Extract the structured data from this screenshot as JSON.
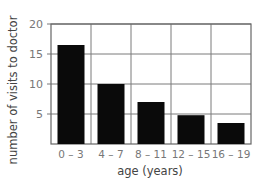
{
  "chart_data": {
    "type": "bar",
    "title": "",
    "xlabel": "age (years)",
    "ylabel": "number of visits to doctor",
    "categories": [
      "0 – 3",
      "4 – 7",
      "8 – 11",
      "12 – 15",
      "16 – 19"
    ],
    "values": [
      16.5,
      10,
      7,
      4.8,
      3.5
    ],
    "ylim": [
      0,
      20
    ],
    "yticks": [
      5,
      10,
      15,
      20
    ],
    "grid": true,
    "bar_color": "#0a0a0a",
    "grid_color": "#7a7a7a"
  }
}
